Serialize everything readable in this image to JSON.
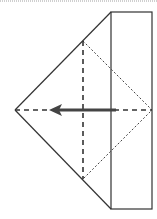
{
  "diagram": {
    "type": "origami-fold-step",
    "colors": {
      "line": "#333333",
      "arrow": "#444444",
      "background": "#ffffff"
    },
    "elements": {
      "rectangle_flap": {
        "x": 111,
        "y": 12,
        "width": 41,
        "height": 197
      },
      "triangle": {
        "apex_left": [
          15,
          110
        ],
        "top": [
          111,
          12
        ],
        "bottom": [
          111,
          209
        ]
      },
      "valley_fold_vertical": {
        "x": 83,
        "y1": 41,
        "y2": 179
      },
      "valley_fold_horizontal": {
        "y": 110,
        "x1": 15,
        "x2": 152
      },
      "hidden_edges": [
        [
          83,
          41
        ],
        [
          152,
          110
        ],
        [
          83,
          179
        ]
      ],
      "fold_arrow": {
        "from": [
          116,
          110
        ],
        "to": [
          50,
          110
        ],
        "direction": "left"
      }
    }
  }
}
